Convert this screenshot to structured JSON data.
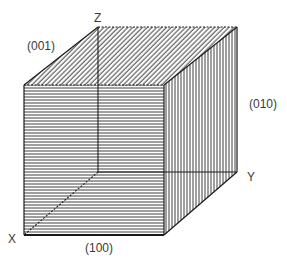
{
  "figure": {
    "type": "crystal-cube-faces",
    "ink_color": "#1a1a1a",
    "background": "#ffffff"
  },
  "axes": {
    "x_label": "X",
    "y_label": "Y",
    "z_label": "Z"
  },
  "faces": {
    "front": {
      "label": "(100)",
      "hatch": "horizontal"
    },
    "top": {
      "label": "(001)",
      "hatch": "diagonal"
    },
    "side": {
      "label": "(010)",
      "hatch": "vertical"
    }
  },
  "vertices": {
    "front_top_left": [
      24,
      85
    ],
    "front_top_right": [
      164,
      85
    ],
    "front_bottom_left": [
      24,
      235
    ],
    "front_bottom_right": [
      164,
      235
    ],
    "back_top_left": [
      98,
      27
    ],
    "back_top_right": [
      237,
      27
    ],
    "back_bottom_left": [
      98,
      172
    ],
    "back_bottom_right": [
      237,
      172
    ]
  }
}
